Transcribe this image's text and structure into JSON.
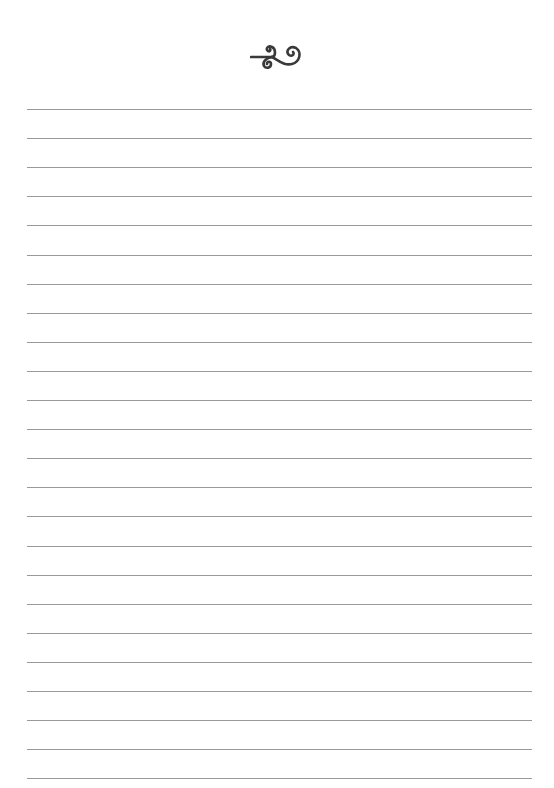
{
  "page": {
    "type": "lined-writing-paper",
    "background": "#ffffff",
    "line_color": "#9a9a9a",
    "ornament_color": "#3a3a3a",
    "ornament": "swirl-flourish-icon",
    "line_count": 24,
    "first_line_y": 109,
    "line_spacing": 29.1,
    "line_left": 27,
    "line_right": 532
  }
}
